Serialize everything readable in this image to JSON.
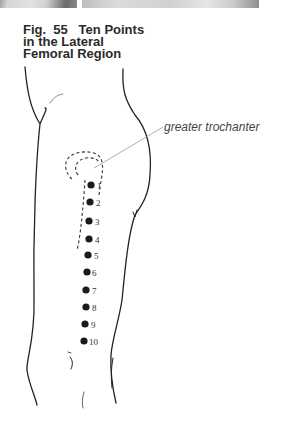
{
  "figure": {
    "title_lines": [
      "Fig.  55   Ten Points",
      "in the Lateral",
      "Femoral Region"
    ],
    "annotation": "greater trochanter",
    "points": [
      {
        "label": "1",
        "x": 91,
        "y": 185
      },
      {
        "label": "2",
        "x": 90,
        "y": 202
      },
      {
        "label": "3",
        "x": 89,
        "y": 221
      },
      {
        "label": "4",
        "x": 89,
        "y": 239
      },
      {
        "label": "5",
        "x": 88,
        "y": 255
      },
      {
        "label": "6",
        "x": 87,
        "y": 272
      },
      {
        "label": "7",
        "x": 86,
        "y": 290
      },
      {
        "label": "8",
        "x": 86,
        "y": 307
      },
      {
        "label": "9",
        "x": 85,
        "y": 324
      },
      {
        "label": "10",
        "x": 84,
        "y": 341
      }
    ],
    "colors": {
      "line": "#222222",
      "dot": "#1a1a1a",
      "leader": "#9a9a9a"
    }
  }
}
